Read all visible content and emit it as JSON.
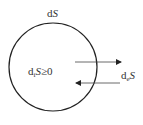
{
  "diagram": {
    "top_label": {
      "prefix": "d",
      "var": "S"
    },
    "inner_label": {
      "prefix": "d",
      "sub": "i",
      "var": "S",
      "rel": "≥0"
    },
    "exchange_label": {
      "prefix": "d",
      "sub": "e",
      "var": "S"
    },
    "colors": {
      "stroke": "#222222",
      "text": "#333333",
      "background": "#ffffff"
    },
    "arrows": [
      {
        "name": "outflow",
        "direction": "right"
      },
      {
        "name": "inflow",
        "direction": "left"
      }
    ]
  }
}
